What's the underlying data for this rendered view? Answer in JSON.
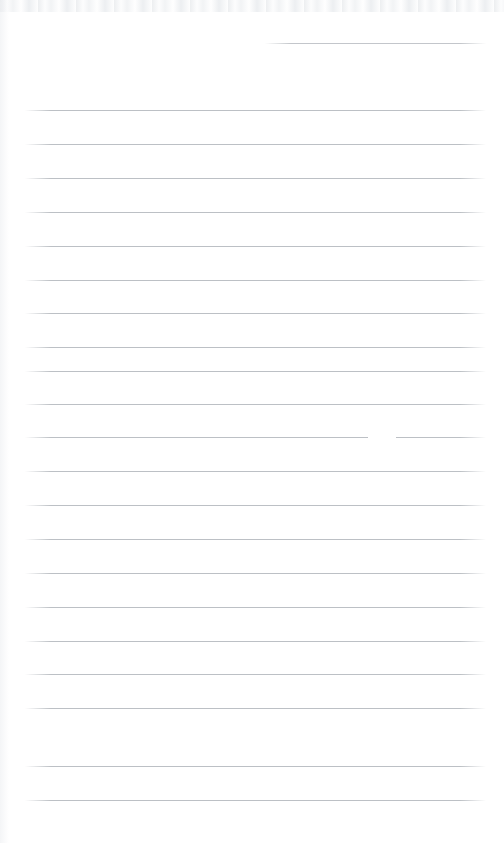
{
  "document": {
    "kind": "scanned-blank-ruled-notebook-page",
    "title": "Blank Ruled Notebook Page",
    "page_width": 504,
    "page_height": 843,
    "background_color": "#ffffff",
    "has_visible_text": false,
    "handwriting_present": false,
    "printed_text_present": false,
    "notes": "Empty lined paper scan; no written or printed content is visible anywhere on the page."
  },
  "ruling": {
    "line_color": "#b9bdc2",
    "line_thickness_px": 1,
    "line_spacing_px": 34,
    "left_margin_x": 25,
    "right_margin_x": 485,
    "full_line_count": 21,
    "partial_line_count": 1,
    "first_full_line_y": 110,
    "last_full_line_y": 800,
    "vertical_margin_rule_present": false
  },
  "partial_line": {
    "label": "top-right short rule",
    "y": 43,
    "x_start": 265,
    "x_end": 486
  },
  "full_lines": [
    {
      "y": 110,
      "x_start": 25,
      "x_end": 486
    },
    {
      "y": 144,
      "x_start": 25,
      "x_end": 486
    },
    {
      "y": 178,
      "x_start": 25,
      "x_end": 486
    },
    {
      "y": 212,
      "x_start": 25,
      "x_end": 486
    },
    {
      "y": 246,
      "x_start": 25,
      "x_end": 486
    },
    {
      "y": 280,
      "x_start": 25,
      "x_end": 486
    },
    {
      "y": 313,
      "x_start": 25,
      "x_end": 486
    },
    {
      "y": 347,
      "x_start": 25,
      "x_end": 486
    },
    {
      "y": 371,
      "x_start": 25,
      "x_end": 486
    },
    {
      "y": 404,
      "x_start": 25,
      "x_end": 486
    },
    {
      "y": 437,
      "x_start": 25,
      "x_end": 486
    },
    {
      "y": 471,
      "x_start": 25,
      "x_end": 486
    },
    {
      "y": 505,
      "x_start": 25,
      "x_end": 486
    },
    {
      "y": 539,
      "x_start": 25,
      "x_end": 486
    },
    {
      "y": 573,
      "x_start": 25,
      "x_end": 486
    },
    {
      "y": 607,
      "x_start": 25,
      "x_end": 486
    },
    {
      "y": 641,
      "x_start": 25,
      "x_end": 486
    },
    {
      "y": 674,
      "x_start": 25,
      "x_end": 486
    },
    {
      "y": 708,
      "x_start": 25,
      "x_end": 486
    },
    {
      "y": 766,
      "x_start": 25,
      "x_end": 486
    },
    {
      "y": 800,
      "x_start": 25,
      "x_end": 486
    }
  ],
  "artifacts": {
    "erased_gap": {
      "label": "faded break in rule",
      "on_line_y": 437,
      "x_start": 368,
      "x_end": 396
    },
    "top_edge_noise_band_height": 12,
    "left_edge_shadow_width": 9
  }
}
